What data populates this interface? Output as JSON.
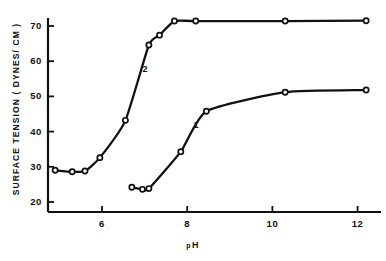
{
  "chart_data": {
    "type": "line",
    "title": "",
    "xlabel": "pH",
    "ylabel": "SURFACE TENSION ( DYNES/ CM )",
    "xlim": [
      4.7,
      12.7
    ],
    "ylim": [
      20,
      73
    ],
    "xticks": [
      6,
      8,
      10,
      12
    ],
    "yticks": [
      20,
      30,
      40,
      50,
      60,
      70
    ],
    "grid": false,
    "legend": "inline-curve-labels",
    "series": [
      {
        "name": "1",
        "label": "1",
        "label_x": 8.15,
        "label_y": 41.5,
        "points": [
          {
            "x": 6.7,
            "y": 24.2
          },
          {
            "x": 6.95,
            "y": 23.6
          },
          {
            "x": 7.1,
            "y": 23.8
          },
          {
            "x": 7.85,
            "y": 34.3
          },
          {
            "x": 8.45,
            "y": 45.8
          },
          {
            "x": 10.3,
            "y": 51.2
          },
          {
            "x": 12.2,
            "y": 51.8
          }
        ]
      },
      {
        "name": "2",
        "label": "2",
        "label_x": 6.95,
        "label_y": 57.5,
        "points": [
          {
            "x": 4.9,
            "y": 29.0
          },
          {
            "x": 5.3,
            "y": 28.6
          },
          {
            "x": 5.6,
            "y": 28.8
          },
          {
            "x": 5.95,
            "y": 32.6
          },
          {
            "x": 6.55,
            "y": 43.2
          },
          {
            "x": 7.1,
            "y": 64.6
          },
          {
            "x": 7.35,
            "y": 67.4
          },
          {
            "x": 7.7,
            "y": 71.4
          },
          {
            "x": 8.2,
            "y": 71.4
          },
          {
            "x": 10.3,
            "y": 71.4
          },
          {
            "x": 12.2,
            "y": 71.5
          }
        ]
      }
    ]
  },
  "axes": {
    "y_title": "SURFACE TENSION ( DYNES/ CM )",
    "x_title_main": "H",
    "x_title_prefix": "p",
    "y_tick_labels": [
      "70",
      "60",
      "50",
      "40",
      "30",
      "20"
    ],
    "x_tick_labels": [
      "6",
      "8",
      "10",
      "12"
    ]
  },
  "style": {
    "line_color": "#111111",
    "axis_color": "#111111",
    "marker_fill": "#ffffff",
    "background": "#ffffff"
  }
}
